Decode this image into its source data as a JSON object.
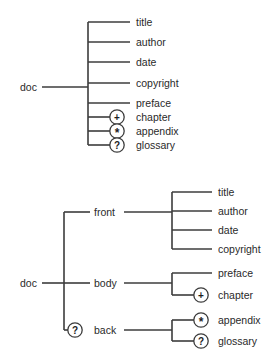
{
  "figure": {
    "background_color": "#ffffff",
    "line_color": "#3c3c3c",
    "text_color": "#2a2a2a",
    "width": 274,
    "height": 362
  },
  "occurrence_symbols": {
    "plus": "+",
    "star": "*",
    "question": "?"
  },
  "diagrams": [
    {
      "id": "flat-content-model",
      "root": {
        "label": "doc",
        "x": 20,
        "y": 87
      },
      "trunk": {
        "x": 88,
        "y1": 22,
        "y2": 144
      },
      "stem": {
        "x1": 42,
        "x2": 88,
        "y": 87
      },
      "children": [
        {
          "label": "title",
          "occurrence": null,
          "y": 22,
          "label_x": 136,
          "line_x1": 88,
          "line_x2": 130
        },
        {
          "label": "author",
          "occurrence": null,
          "y": 42,
          "label_x": 136,
          "line_x1": 88,
          "line_x2": 130
        },
        {
          "label": "date",
          "occurrence": null,
          "y": 62,
          "label_x": 136,
          "line_x1": 88,
          "line_x2": 130
        },
        {
          "label": "copyright",
          "occurrence": null,
          "y": 83,
          "label_x": 136,
          "line_x1": 88,
          "line_x2": 130
        },
        {
          "label": "preface",
          "occurrence": null,
          "y": 103,
          "label_x": 136,
          "line_x1": 88,
          "line_x2": 130
        },
        {
          "label": "chapter",
          "occurrence": "plus",
          "y": 117,
          "label_x": 136,
          "line_x1": 88,
          "line_x2": 110,
          "circle_x": 117
        },
        {
          "label": "appendix",
          "occurrence": "star",
          "y": 131,
          "label_x": 136,
          "line_x1": 88,
          "line_x2": 110,
          "circle_x": 117
        },
        {
          "label": "glossary",
          "occurrence": "question",
          "y": 145,
          "label_x": 136,
          "line_x1": 88,
          "line_x2": 110,
          "circle_x": 117
        }
      ]
    },
    {
      "id": "nested-content-model",
      "root": {
        "label": "doc",
        "x": 20,
        "y": 283
      },
      "trunk": {
        "x": 64,
        "y1": 212,
        "y2": 330
      },
      "stem": {
        "x1": 42,
        "x2": 64,
        "y": 283
      },
      "branches": [
        {
          "label": "front",
          "occurrence": null,
          "y": 212,
          "label_x": 94,
          "stub_x1": 64,
          "stub_x2": 90,
          "out_x1": 124,
          "out_x2": 172,
          "subtrunk": {
            "x": 172,
            "y1": 192,
            "y2": 249
          },
          "children": [
            {
              "label": "title",
              "occurrence": null,
              "y": 192,
              "label_x": 218,
              "line_x1": 172,
              "line_x2": 212
            },
            {
              "label": "author",
              "occurrence": null,
              "y": 211,
              "label_x": 218,
              "line_x1": 172,
              "line_x2": 212
            },
            {
              "label": "date",
              "occurrence": null,
              "y": 230,
              "label_x": 218,
              "line_x1": 172,
              "line_x2": 212
            },
            {
              "label": "copyright",
              "occurrence": null,
              "y": 249,
              "label_x": 218,
              "line_x1": 172,
              "line_x2": 212
            }
          ]
        },
        {
          "label": "body",
          "occurrence": null,
          "y": 283,
          "label_x": 94,
          "stub_x1": 64,
          "stub_x2": 90,
          "out_x1": 124,
          "out_x2": 172,
          "subtrunk": {
            "x": 172,
            "y1": 273,
            "y2": 295
          },
          "children": [
            {
              "label": "preface",
              "occurrence": null,
              "y": 273,
              "label_x": 218,
              "line_x1": 172,
              "line_x2": 212
            },
            {
              "label": "chapter",
              "occurrence": "plus",
              "y": 295,
              "label_x": 218,
              "line_x1": 172,
              "line_x2": 194,
              "circle_x": 201
            }
          ]
        },
        {
          "label": "back",
          "occurrence": "question",
          "y": 330,
          "label_x": 94,
          "circle_x": 75,
          "stub_x1": 64,
          "stub_x2": 67,
          "out_x1": 124,
          "out_x2": 172,
          "subtrunk": {
            "x": 172,
            "y1": 320,
            "y2": 341
          },
          "children": [
            {
              "label": "appendix",
              "occurrence": "star",
              "y": 320,
              "label_x": 218,
              "line_x1": 172,
              "line_x2": 194,
              "circle_x": 201
            },
            {
              "label": "glossary",
              "occurrence": "question",
              "y": 341,
              "label_x": 218,
              "line_x1": 172,
              "line_x2": 194,
              "circle_x": 201
            }
          ]
        }
      ]
    }
  ]
}
